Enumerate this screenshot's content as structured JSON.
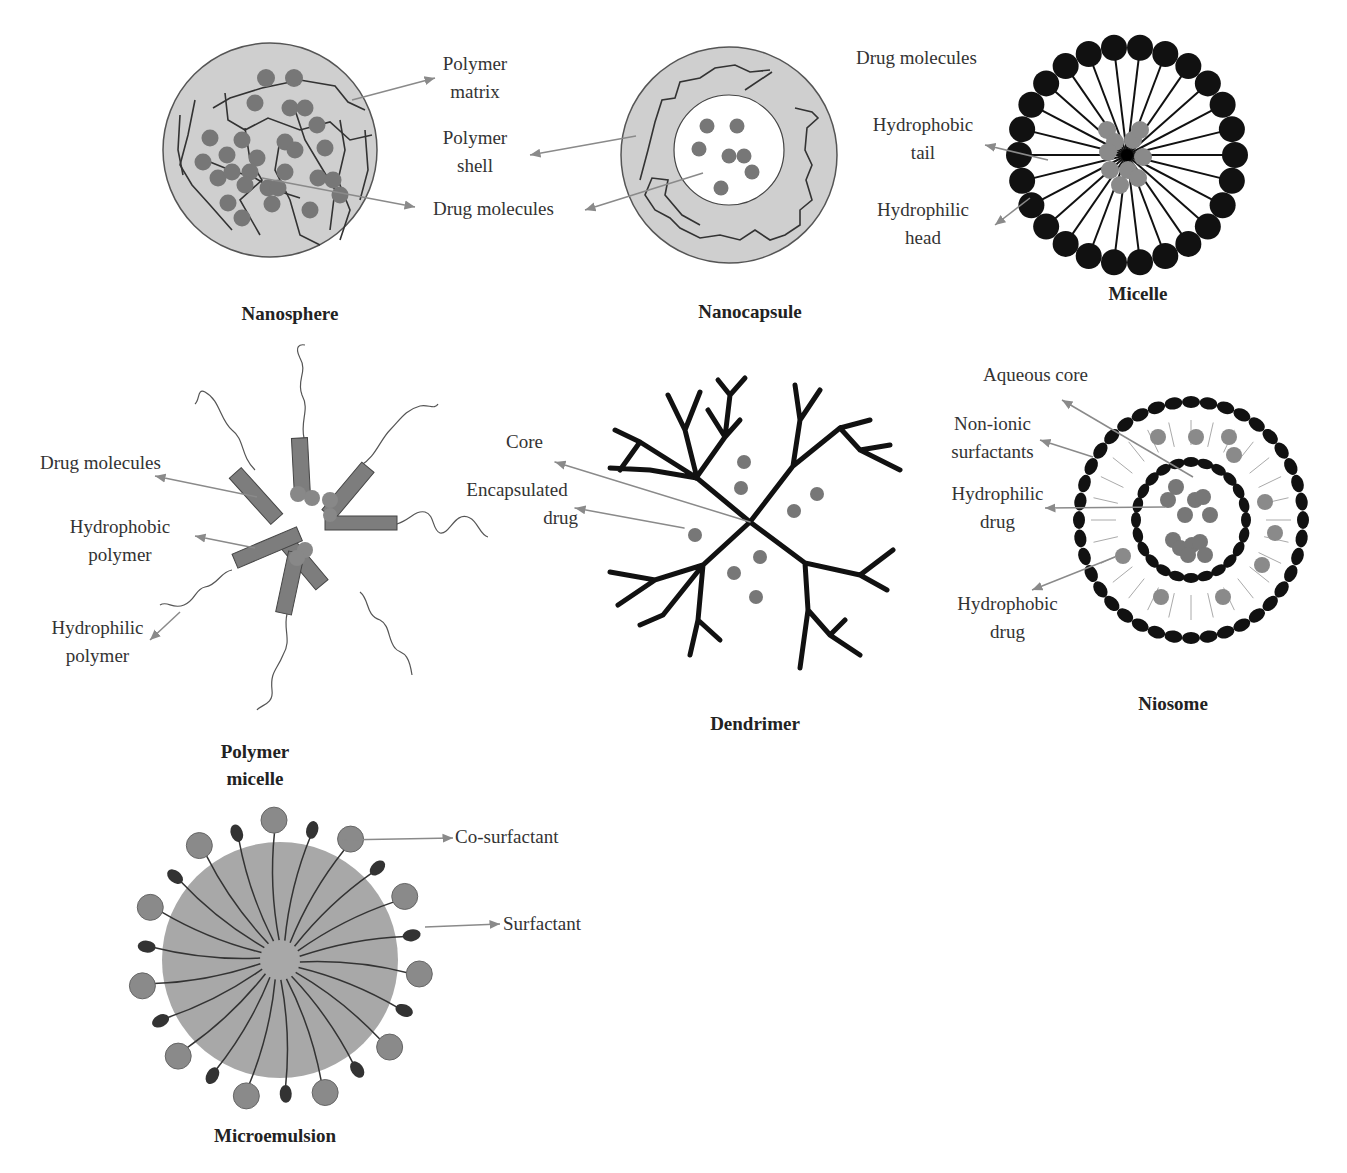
{
  "colors": {
    "background": "#ffffff",
    "particle_fill": "#c8c8c8",
    "drug_dot": "#7a7a7a",
    "dark_head": "#111111",
    "arrow": "#8a8a8a",
    "polymer_block": "#7d7d7d"
  },
  "nanosphere": {
    "title": "Nanosphere",
    "labels": {
      "polymer_matrix_1": "Polymer",
      "polymer_matrix_2": "matrix",
      "drug_molecules": "Drug molecules"
    }
  },
  "nanocapsule": {
    "title": "Nanocapsule",
    "labels": {
      "polymer_shell_1": "Polymer",
      "polymer_shell_2": "shell"
    }
  },
  "micelle": {
    "title": "Micelle",
    "labels": {
      "drug_molecules": "Drug molecules",
      "hydrophobic_tail_1": "Hydrophobic",
      "hydrophobic_tail_2": "tail",
      "hydrophilic_head_1": "Hydrophilic",
      "hydrophilic_head_2": "head"
    }
  },
  "polymer_micelle": {
    "title_1": "Polymer",
    "title_2": "micelle",
    "labels": {
      "drug_molecules": "Drug molecules",
      "hydrophobic_polymer_1": "Hydrophobic",
      "hydrophobic_polymer_2": "polymer",
      "hydrophilic_polymer_1": "Hydrophilic",
      "hydrophilic_polymer_2": "polymer"
    }
  },
  "dendrimer": {
    "title": "Dendrimer",
    "labels": {
      "core": "Core",
      "encapsulated_drug_1": "Encapsulated",
      "encapsulated_drug_2": "drug"
    }
  },
  "niosome": {
    "title": "Niosome",
    "labels": {
      "aqueous_core": "Aqueous core",
      "non_ionic_1": "Non-ionic",
      "non_ionic_2": "surfactants",
      "hydrophilic_drug_1": "Hydrophilic",
      "hydrophilic_drug_2": "drug",
      "hydrophobic_drug_1": "Hydrophobic",
      "hydrophobic_drug_2": "drug"
    }
  },
  "microemulsion": {
    "title": "Microemulsion",
    "labels": {
      "co_surfactant": "Co-surfactant",
      "surfactant": "Surfactant"
    }
  }
}
